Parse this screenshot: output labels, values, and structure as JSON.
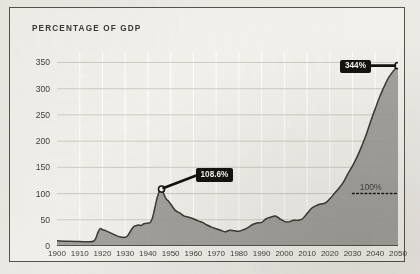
{
  "chart_data": {
    "type": "area",
    "title": "PERCENTAGE OF GDP",
    "xlabel": "",
    "ylabel": "",
    "xlim": [
      1900,
      2050
    ],
    "ylim": [
      0,
      370
    ],
    "yticks": [
      0,
      50,
      100,
      150,
      200,
      250,
      300,
      350
    ],
    "xticks": [
      1900,
      1910,
      1920,
      1930,
      1940,
      1950,
      1960,
      1970,
      1980,
      1990,
      2000,
      2010,
      2020,
      2030,
      2040,
      2050
    ],
    "grid": "horizontal-and-vertical",
    "legend": "none",
    "series": [
      {
        "name": "Debt as percentage of GDP",
        "x": [
          1900,
          1905,
          1910,
          1914,
          1916,
          1917,
          1918,
          1919,
          1920,
          1921,
          1922,
          1924,
          1926,
          1928,
          1930,
          1931,
          1932,
          1933,
          1934,
          1935,
          1936,
          1937,
          1938,
          1939,
          1940,
          1941,
          1942,
          1943,
          1944,
          1945,
          1946,
          1947,
          1948,
          1949,
          1950,
          1952,
          1954,
          1956,
          1958,
          1960,
          1962,
          1964,
          1966,
          1968,
          1970,
          1972,
          1974,
          1976,
          1978,
          1980,
          1982,
          1984,
          1986,
          1988,
          1990,
          1992,
          1994,
          1996,
          1998,
          2000,
          2002,
          2004,
          2006,
          2008,
          2010,
          2012,
          2014,
          2016,
          2018,
          2020,
          2022,
          2024,
          2026,
          2028,
          2030,
          2032,
          2034,
          2036,
          2038,
          2040,
          2042,
          2044,
          2046,
          2048,
          2050
        ],
        "y": [
          10,
          9,
          8.5,
          8,
          9,
          14,
          26,
          33,
          31,
          30,
          28,
          24,
          20,
          17,
          16.5,
          19,
          26,
          33,
          38,
          39,
          40,
          39,
          42,
          43,
          44,
          45,
          54,
          72,
          91,
          104,
          108.6,
          99,
          90,
          86,
          80,
          68,
          63,
          57,
          55,
          52,
          48,
          45,
          40,
          36,
          33,
          30,
          27,
          30,
          29,
          28,
          31,
          35,
          41,
          44,
          45,
          52,
          55,
          57,
          52,
          47,
          46,
          49,
          49,
          52,
          62,
          72,
          77,
          80,
          82,
          90,
          100,
          110,
          122,
          138,
          153,
          170,
          190,
          212,
          238,
          262,
          285,
          305,
          322,
          334,
          344
        ]
      }
    ],
    "annotations": [
      {
        "name": "ww2-peak",
        "label": "108.6%",
        "x": 1946,
        "y": 108.6,
        "marker": "open-circle"
      },
      {
        "name": "projection-endpoint",
        "label": "344%",
        "x": 2050,
        "y": 344,
        "marker": "open-circle"
      },
      {
        "name": "hundred-percent-line",
        "label": "100%",
        "y": 100,
        "style": "dotted-horizontal",
        "x_start": 2030,
        "x_end": 2050
      }
    ],
    "colors": {
      "area_fill": "#9b9a95",
      "line": "#3c3a35",
      "gridline": "#ffffff",
      "background": "#f2f0eb",
      "annotation_background": "#15130f",
      "annotation_text": "#f6f4ef",
      "axis_text": "#44413c",
      "frame_border": "#56534d"
    }
  }
}
